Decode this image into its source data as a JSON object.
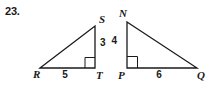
{
  "problem": {
    "number": "23."
  },
  "figures": [
    {
      "name": "triangle-rst",
      "vertices": [
        {
          "label": "R",
          "x": 40,
          "y": 68,
          "label_x": 33,
          "label_y": 78
        },
        {
          "label": "S",
          "x": 95,
          "y": 26,
          "label_x": 99,
          "label_y": 23
        },
        {
          "label": "T",
          "x": 95,
          "y": 68,
          "label_x": 96,
          "label_y": 79
        }
      ],
      "side_labels": [
        {
          "value": "5",
          "x": 65,
          "y": 78
        },
        {
          "value": "3",
          "x": 100,
          "y": 46
        }
      ],
      "right_angle_at": "T"
    },
    {
      "name": "triangle-npq",
      "vertices": [
        {
          "label": "N",
          "x": 127,
          "y": 22,
          "label_x": 119,
          "label_y": 17
        },
        {
          "label": "P",
          "x": 127,
          "y": 68,
          "label_x": 119,
          "label_y": 79
        },
        {
          "label": "Q",
          "x": 197,
          "y": 68,
          "label_x": 197,
          "label_y": 79
        }
      ],
      "side_labels": [
        {
          "value": "4",
          "x": 117,
          "y": 44
        },
        {
          "value": "6",
          "x": 159,
          "y": 78
        }
      ],
      "right_angle_at": "P"
    }
  ],
  "colors": {
    "ink": "#1a1a1a",
    "page": "#ffffff"
  }
}
